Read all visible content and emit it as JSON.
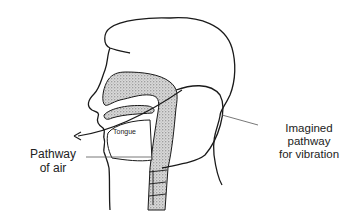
{
  "diagram": {
    "type": "anatomical-cross-section",
    "labels": {
      "tongue": "Tongue",
      "pathway_of_air": {
        "line1": "Pathway",
        "line2": "of air"
      },
      "imagined_pathway": {
        "line1": "Imagined",
        "line2": "pathway",
        "line3": "for vibration"
      }
    },
    "colors": {
      "stroke": "#1a1a1a",
      "stipple_fill": "#bdbdbd",
      "background": "#ffffff",
      "text": "#222222"
    }
  }
}
